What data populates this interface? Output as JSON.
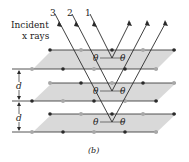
{
  "labels": {
    "incident_line1": "Incident",
    "incident_line2": "x rays",
    "ray_1": "1",
    "ray_2": "2",
    "ray_3": "3",
    "theta": "θ",
    "spacing": "d",
    "caption": "(b)"
  },
  "colors": {
    "plane_fill": "#d9d9d9",
    "line": "#2a2a2a",
    "atom_dark": "#2a2a2a",
    "atom_light": "#a8a8a8"
  },
  "planes": [
    {
      "back_y": 50,
      "front_y": 69
    },
    {
      "back_y": 83,
      "front_y": 101
    },
    {
      "back_y": 114,
      "front_y": 132
    }
  ]
}
